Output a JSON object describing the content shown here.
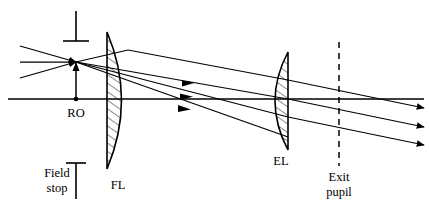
{
  "diagram": {
    "background_color": "#ffffff",
    "line_color": "#000000",
    "labels": {
      "reference_object": "RO",
      "field_lens": "FL",
      "eye_lens": "EL",
      "field_stop": "Field",
      "field_stop_line2": "stop",
      "exit_pupil": "Exit",
      "exit_pupil_line2": "pupil"
    },
    "elements": {
      "optical_axis": {
        "name": "optical-axis",
        "y": 99,
        "x_start": 8,
        "x_end": 424
      },
      "field_lens": {
        "name": "field-lens",
        "abbrev": "FL",
        "type": "plano-convex",
        "flat_side": "left",
        "x_flat": 107,
        "x_apex": 128,
        "y_top": 32,
        "y_bottom": 169,
        "hatched": true
      },
      "eye_lens": {
        "name": "eye-lens",
        "abbrev": "EL",
        "type": "plano-convex",
        "flat_side": "right",
        "x_flat": 288,
        "x_apex": 268,
        "y_top": 52,
        "y_bottom": 150,
        "hatched": true
      },
      "exit_pupil_line": {
        "name": "exit-pupil-line",
        "x": 339,
        "y_top": 42,
        "y_bottom": 166,
        "style": "dashed"
      },
      "field_stop_marker_top": {
        "name": "field-stop-marker-top",
        "x": 76,
        "y_top": 11,
        "y_bottom": 41,
        "crossbar_y": 41,
        "crossbar_half_width": 13
      },
      "field_stop_marker_legend": {
        "name": "field-stop-marker-legend",
        "x": 76,
        "y_top": 163,
        "y_bottom": 199,
        "crossbar_y": 163,
        "crossbar_half_width": 10
      },
      "reference_object_arrow": {
        "name": "reference-object-arrow",
        "x": 76,
        "y_base": 99,
        "y_tip": 62
      }
    },
    "rays": {
      "incoming_count": 3,
      "crossing_point": {
        "x": 76,
        "y": 62
      },
      "incoming": [
        {
          "name": "incoming-ray-upper",
          "x1": 20,
          "y1": 46,
          "x2": 76,
          "y2": 62
        },
        {
          "name": "incoming-ray-middle",
          "x1": 20,
          "y1": 62,
          "x2": 76,
          "y2": 62
        },
        {
          "name": "incoming-ray-lower",
          "x1": 20,
          "y1": 78,
          "x2": 76,
          "y2": 62
        }
      ],
      "between_lenses": [
        {
          "name": "ray-segment-upper",
          "x1": 76,
          "y1": 62,
          "x2": 288,
          "y2": 99
        },
        {
          "name": "ray-segment-middle",
          "x1": 76,
          "y1": 62,
          "x2": 288,
          "y2": 117
        },
        {
          "name": "ray-segment-lower",
          "x1": 76,
          "y1": 62,
          "x2": 288,
          "y2": 137
        }
      ],
      "outgoing": [
        {
          "name": "outgoing-ray-upper",
          "x1": 288,
          "y1": 99,
          "x2": 424,
          "y2": 139
        },
        {
          "name": "outgoing-ray-middle",
          "x1": 288,
          "y1": 117,
          "x2": 424,
          "y2": 157
        },
        {
          "name": "outgoing-ray-lower",
          "x1": 288,
          "y1": 137,
          "x2": 424,
          "y2": 177
        }
      ]
    },
    "label_positions": {
      "ro": {
        "x": 76,
        "y": 115
      },
      "fl": {
        "x": 118,
        "y": 188
      },
      "el": {
        "x": 281,
        "y": 163
      },
      "field_stop": {
        "x": 57,
        "y": 176
      },
      "exit_pupil": {
        "x": 339,
        "y": 180
      }
    }
  }
}
